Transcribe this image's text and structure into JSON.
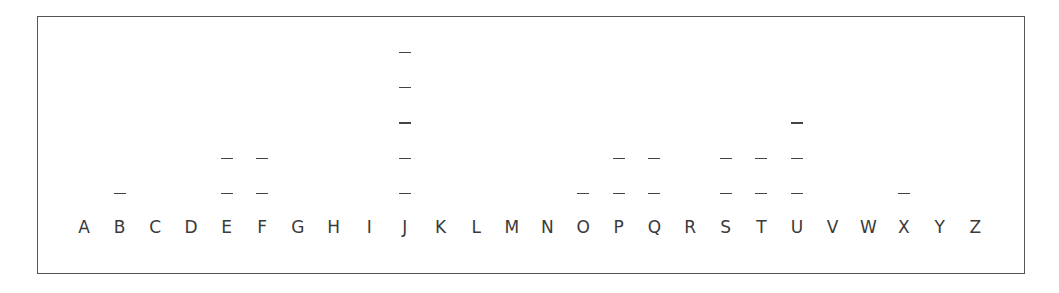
{
  "chart_data": {
    "type": "bar",
    "title": "",
    "xlabel": "",
    "ylabel": "",
    "style": "stacked dash tally marks per letter",
    "categories": [
      "A",
      "B",
      "C",
      "D",
      "E",
      "F",
      "G",
      "H",
      "I",
      "J",
      "K",
      "L",
      "M",
      "N",
      "O",
      "P",
      "Q",
      "R",
      "S",
      "T",
      "U",
      "V",
      "W",
      "X",
      "Y",
      "Z"
    ],
    "values": [
      0,
      1,
      0,
      0,
      2,
      2,
      0,
      0,
      0,
      5,
      0,
      0,
      0,
      0,
      1,
      2,
      2,
      0,
      2,
      2,
      3,
      0,
      0,
      1,
      0,
      0
    ],
    "ylim": [
      0,
      5
    ],
    "grid": false,
    "legend": null
  }
}
